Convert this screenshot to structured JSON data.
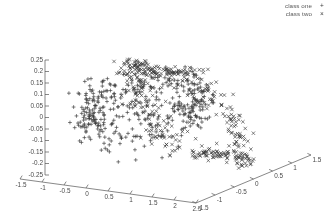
{
  "chart_data": {
    "type": "scatter",
    "title": "",
    "subtitle": "",
    "projection": "3d",
    "xlabel": "",
    "ylabel": "",
    "zlabel": "",
    "grid": false,
    "legend_position": "top-right",
    "xlim": [
      -1.5,
      2.5
    ],
    "ylim": [
      -1.5,
      1.5
    ],
    "zlim": [
      -0.25,
      0.25
    ],
    "xticks": [
      "-1.5",
      "-1",
      "-0.5",
      "0",
      "0.5",
      "1",
      "1.5",
      "2",
      "2.5"
    ],
    "xtick_values": [
      -1.5,
      -1,
      -0.5,
      0,
      0.5,
      1,
      1.5,
      2,
      2.5
    ],
    "yticks": [
      "-1.5",
      "-1",
      "-0.5",
      "0",
      "0.5",
      "1",
      "1.5"
    ],
    "ytick_values": [
      -1.5,
      -1,
      -0.5,
      0,
      0.5,
      1,
      1.5
    ],
    "zticks": [
      "0.25",
      "0.2",
      "0.15",
      "0.1",
      "0.05",
      "0",
      "-0.05",
      "-0.1",
      "-0.15",
      "-0.2",
      "-0.25"
    ],
    "ztick_values": [
      0.25,
      0.2,
      0.15,
      0.1,
      0.05,
      0,
      -0.05,
      -0.1,
      -0.15,
      -0.2,
      -0.25
    ],
    "series": [
      {
        "name": "class one",
        "marker": "+",
        "color": "#3a3a3a",
        "ring": {
          "center": [
            0.0,
            0.0,
            0.0
          ],
          "radius": 1.0,
          "plane": "xy",
          "noise_radial": 0.11,
          "noise_z": 0.055,
          "count": 420
        }
      },
      {
        "name": "class two",
        "marker": "x",
        "color": "#3a3a3a",
        "ring": {
          "center": [
            1.0,
            0.0,
            0.0
          ],
          "radius": 1.0,
          "plane": "xz",
          "noise_radial": 0.11,
          "noise_z": 0.055,
          "count": 420
        }
      }
    ]
  },
  "legend": {
    "items": [
      {
        "label": "class one",
        "key": "+"
      },
      {
        "label": "class two",
        "key": "×"
      }
    ]
  },
  "axes": {
    "line_color": "#555555",
    "tick_label_color": "#4a4a4a"
  }
}
